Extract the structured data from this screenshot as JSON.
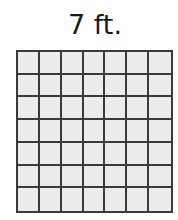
{
  "diagram": {
    "label": "7 ft.",
    "grid": {
      "rows": 7,
      "columns": 7,
      "cell_fill": "#ececec",
      "line_color": "#3a3a3a"
    }
  }
}
